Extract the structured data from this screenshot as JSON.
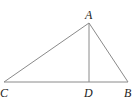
{
  "diagram": {
    "type": "geometry-triangle",
    "points": {
      "A": {
        "label": "A",
        "x": 89,
        "y": 23
      },
      "B": {
        "label": "B",
        "x": 128,
        "y": 82
      },
      "C": {
        "label": "C",
        "x": 4,
        "y": 82
      },
      "D": {
        "label": "D",
        "x": 89,
        "y": 82
      }
    },
    "segments": [
      {
        "from": "A",
        "to": "B"
      },
      {
        "from": "A",
        "to": "C"
      },
      {
        "from": "C",
        "to": "B"
      },
      {
        "from": "A",
        "to": "D"
      }
    ],
    "colors": {
      "line": "#8a8a8a",
      "label": "#222222",
      "background": "#ffffff"
    }
  }
}
